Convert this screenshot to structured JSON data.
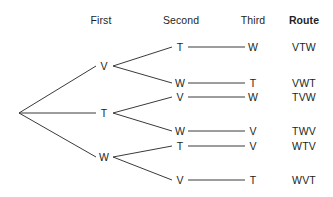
{
  "headers": [
    {
      "label": "First",
      "x": 101,
      "y": 20,
      "bold": false
    },
    {
      "label": "Second",
      "x": 181,
      "y": 20,
      "bold": false
    },
    {
      "label": "Third",
      "x": 253,
      "y": 20,
      "bold": false
    },
    {
      "label": "Route",
      "x": 304,
      "y": 20,
      "bold": true
    }
  ],
  "root": {
    "x": 19,
    "y": 113
  },
  "level1": [
    {
      "label": "V",
      "x": 104,
      "y": 66
    },
    {
      "label": "T",
      "x": 104,
      "y": 113
    },
    {
      "label": "W",
      "x": 104,
      "y": 157
    }
  ],
  "level2": [
    {
      "label": "T",
      "x": 180,
      "y": 47,
      "parent": 0
    },
    {
      "label": "W",
      "x": 180,
      "y": 83,
      "parent": 0
    },
    {
      "label": "V",
      "x": 180,
      "y": 97,
      "parent": 1
    },
    {
      "label": "W",
      "x": 180,
      "y": 131,
      "parent": 1
    },
    {
      "label": "T",
      "x": 180,
      "y": 146,
      "parent": 2
    },
    {
      "label": "V",
      "x": 180,
      "y": 180,
      "parent": 2
    }
  ],
  "level3": [
    {
      "label": "W",
      "x": 253,
      "y": 47
    },
    {
      "label": "T",
      "x": 253,
      "y": 83
    },
    {
      "label": "W",
      "x": 253,
      "y": 97
    },
    {
      "label": "V",
      "x": 253,
      "y": 131
    },
    {
      "label": "V",
      "x": 253,
      "y": 146
    },
    {
      "label": "T",
      "x": 253,
      "y": 180
    }
  ],
  "routes": [
    {
      "label": "VTW",
      "x": 304,
      "y": 47
    },
    {
      "label": "VWT",
      "x": 304,
      "y": 83
    },
    {
      "label": "TVW",
      "x": 304,
      "y": 97
    },
    {
      "label": "TWV",
      "x": 304,
      "y": 131
    },
    {
      "label": "WTV",
      "x": 304,
      "y": 146
    },
    {
      "label": "WVT",
      "x": 304,
      "y": 180
    }
  ],
  "style": {
    "line_color": "#3a3a3a",
    "text_color": "#231f20",
    "background": "#ffffff",
    "line_width": 1
  },
  "geometry": {
    "root_stub_x": 24,
    "level1_left_x": 96,
    "level1_right_x": 113,
    "level2_left_x": 172,
    "level2_right_x": 188,
    "level3_left_x": 245
  }
}
